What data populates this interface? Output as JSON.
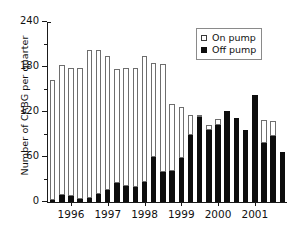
{
  "chart_data": {
    "type": "bar",
    "subtype": "stacked-vertical",
    "title": "",
    "xlabel": "",
    "ylabel": "Number of CABG per quarter",
    "ylim": [
      0,
      240
    ],
    "yticks": [
      0,
      60,
      120,
      180,
      240
    ],
    "yticks_minor": [
      30,
      90,
      150,
      210
    ],
    "grid": false,
    "legend_position": "top-right",
    "categories": [
      "1995 Q4",
      "1996 Q1",
      "1996 Q2",
      "1996 Q3",
      "1996 Q4",
      "1997 Q1",
      "1997 Q2",
      "1997 Q3",
      "1997 Q4",
      "1998 Q1",
      "1998 Q2",
      "1998 Q3",
      "1998 Q4",
      "1999 Q1",
      "1999 Q2",
      "1999 Q3",
      "1999 Q4",
      "2000 Q1",
      "2000 Q2",
      "2000 Q3",
      "2000 Q4",
      "2001 Q1",
      "2001 Q2",
      "2001 Q3",
      "2001 Q4"
    ],
    "xtick_labels": [
      "1996",
      "1997",
      "1998",
      "1999",
      "2000",
      "2001"
    ],
    "xtick_category_index": [
      2,
      6,
      10,
      14,
      18,
      22
    ],
    "series": [
      {
        "name": "Off pump",
        "color": "#0d0d0d",
        "marker": "filled-square",
        "values": [
          3,
          9,
          8,
          4,
          5,
          11,
          16,
          26,
          22,
          20,
          27,
          60,
          40,
          41,
          59,
          90,
          113,
          96,
          103,
          121,
          112,
          96,
          143,
          79,
          88
        ]
      },
      {
        "name": "On pump",
        "color": "#ffffff",
        "marker": "open-square",
        "values": [
          158,
          173,
          169,
          174,
          196,
          190,
          178,
          150,
          156,
          157,
          166,
          124,
          143,
          88,
          66,
          25,
          2,
          5,
          6,
          0,
          0,
          0,
          0,
          29,
          19
        ]
      }
    ],
    "totals": [
      161,
      182,
      177,
      178,
      201,
      201,
      194,
      176,
      178,
      177,
      193,
      184,
      183,
      129,
      125,
      115,
      115,
      101,
      109,
      121,
      112,
      96,
      143,
      108,
      107
    ],
    "tail_bar_total": 67,
    "tail_bar_off": 67
  },
  "legend": {
    "items": [
      {
        "label": "On pump",
        "swatch": "open-square"
      },
      {
        "label": "Off pump",
        "swatch": "filled-square"
      }
    ]
  },
  "axes": {
    "y_title": "Number of CABG per quarter",
    "y_tick_labels": [
      "0",
      "60",
      "120",
      "180",
      "240"
    ],
    "x_tick_labels": [
      "1996",
      "1997",
      "1998",
      "1999",
      "2000",
      "2001"
    ]
  }
}
